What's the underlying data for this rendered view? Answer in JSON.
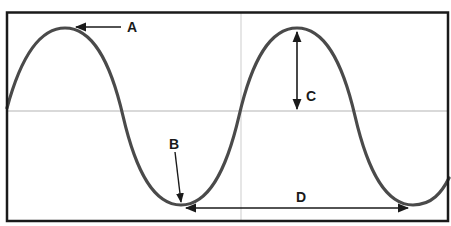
{
  "diagram": {
    "type": "wave-anatomy",
    "colors": {
      "frame": "#1a1a1a",
      "wave": "#4a4a4a",
      "axis": "#cccccc",
      "arrow": "#1a1a1a",
      "background": "#ffffff"
    },
    "labels": {
      "a": "A",
      "b": "B",
      "c": "C",
      "d": "D"
    },
    "annotations": [
      {
        "id": "A",
        "points_to": "crest",
        "arrow": "single, pointing left to first peak"
      },
      {
        "id": "B",
        "points_to": "trough",
        "arrow": "single, pointing down to first trough"
      },
      {
        "id": "C",
        "points_to": "amplitude",
        "arrow": "double-headed vertical, from peak to midline"
      },
      {
        "id": "D",
        "points_to": "wavelength",
        "arrow": "double-headed horizontal, trough to trough"
      }
    ]
  }
}
